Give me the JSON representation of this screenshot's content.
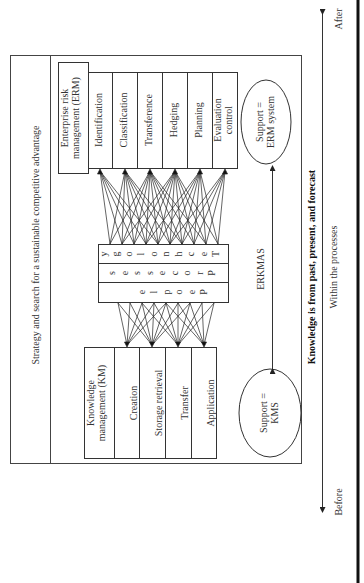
{
  "frame": {
    "strategy_label": "Strategy and search for a sustainable competitive advantage"
  },
  "erm": {
    "header": "Enterprise risk management (ERM)",
    "header_line1": "Enterprise risk",
    "header_line2": "management (ERM)",
    "steps": [
      {
        "label": "Identification"
      },
      {
        "label": "Classification"
      },
      {
        "label": "Transference"
      },
      {
        "label": "Hedging"
      },
      {
        "label": "Planning"
      },
      {
        "label": "Evaluation control",
        "line1": "Evaluation",
        "line2": "control"
      }
    ],
    "support": {
      "line1": "Support =",
      "line2": "ERM system"
    }
  },
  "center": {
    "rows": [
      {
        "word": "Technology"
      },
      {
        "word": "Processes"
      },
      {
        "word": "People"
      }
    ]
  },
  "km": {
    "header": "Knowledge management (KM)",
    "header_line1": "Knowledge",
    "header_line2": "management (KM)",
    "steps": [
      {
        "label": "Creation"
      },
      {
        "label": "Storage retrieval"
      },
      {
        "label": "Transfer"
      },
      {
        "label": "Application"
      }
    ],
    "support": {
      "line1": "Support =",
      "line2": "KMS"
    }
  },
  "link": {
    "label": "ERKMAS"
  },
  "timeline": {
    "knowledge_label": "Knowledge is from past, present, and forecast",
    "process_label": "Within the processes",
    "before_label": "Before",
    "after_label": "After"
  },
  "colors": {
    "line": "#333333",
    "background": "#ffffff"
  }
}
